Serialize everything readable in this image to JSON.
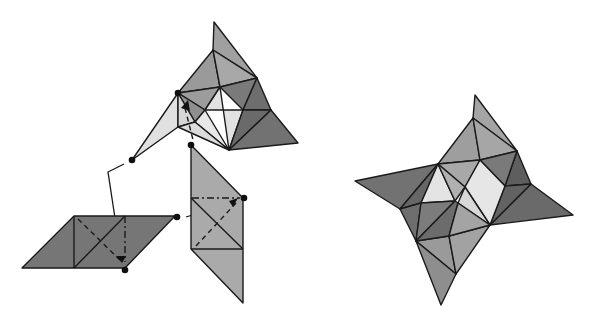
{
  "figure": {
    "shades": {
      "light": "#e4e4e4",
      "mid_light": "#c8c8c8",
      "mid": "#a9a9a9",
      "mid_dark": "#8c8c8c",
      "dark": "#727272",
      "darker": "#5e5e5e"
    },
    "parts": [
      {
        "id": "partial-star",
        "label": "Partially assembled faceted star"
      },
      {
        "id": "horizontal-panel",
        "label": "Horizontal rhombus panel (dark)"
      },
      {
        "id": "vertical-panel",
        "label": "Vertical rhombus panel (medium)"
      },
      {
        "id": "completed-star",
        "label": "Completed four-pointed pinwheel star"
      }
    ],
    "connectors": [
      {
        "from": "partial-star",
        "to": "horizontal-panel",
        "style": "solid"
      },
      {
        "from": "horizontal-panel",
        "to": "vertical-panel",
        "style": "solid"
      }
    ],
    "fold_indicators": [
      {
        "panel": "horizontal-panel",
        "styles": [
          "dashed",
          "dash-dot"
        ],
        "arrow": true
      },
      {
        "panel": "vertical-panel",
        "styles": [
          "dashed",
          "dash-dot"
        ],
        "arrow": true
      },
      {
        "panel": "partial-star",
        "styles": [
          "dashed"
        ],
        "arrow": true
      }
    ]
  }
}
